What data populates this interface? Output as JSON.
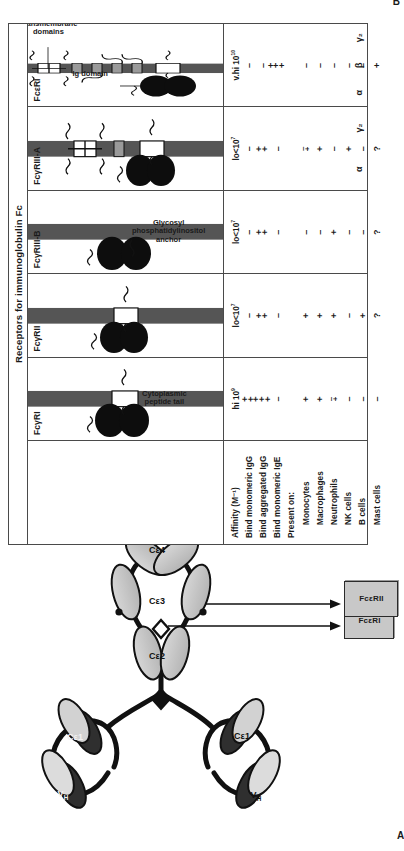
{
  "figure": {
    "panel_a_label": "A",
    "panel_b_label": "B"
  },
  "panel_a": {
    "molecule_domain_labels": {
      "vh": "V",
      "vh_sub": "H",
      "ce1": "Cε1",
      "ce2": "Cε2",
      "ce3": "Cε3",
      "ce4": "Cε4"
    },
    "receptor_boxes": [
      {
        "label": "FcεRI"
      },
      {
        "label": "FcεRII"
      }
    ]
  },
  "panel_b": {
    "table_title": "Receptors for immunoglobulin Fc",
    "annotations": {
      "ig_domain": "Ig domain",
      "transmembrane_domains": "Transmembrane\ndomains",
      "gpi_anchor": "Glycosyl\nphosphatidylinositol\nanchor",
      "cytoplasmic_tail": "Cytoplasmic\npeptide tail"
    },
    "row_labels": [
      {
        "text": "Affinity (M⁻¹)",
        "indent": false
      },
      {
        "text": "Bind monomeric IgG",
        "indent": false
      },
      {
        "text": "Bind aggregated IgG",
        "indent": false
      },
      {
        "text": "Bind monomeric IgE",
        "indent": false
      },
      {
        "text": "Present on:",
        "indent": false
      },
      {
        "text": "Monocytes",
        "indent": true
      },
      {
        "text": "Macrophages",
        "indent": true
      },
      {
        "text": "Neutrophils",
        "indent": true
      },
      {
        "text": "NK cells",
        "indent": true
      },
      {
        "text": "B cells",
        "indent": true
      },
      {
        "text": "Mast cells",
        "indent": true
      }
    ],
    "columns": [
      {
        "name": "FcγRI",
        "subunits": [
          ""
        ],
        "affinity": "hi 10⁹",
        "affinity_base": "hi 10",
        "affinity_exp": "9",
        "values": [
          "++",
          "+++",
          "–",
          "",
          "+",
          "+",
          "+/–",
          "–",
          "–",
          "–"
        ]
      },
      {
        "name": "FcγRII",
        "subunits": [
          ""
        ],
        "affinity": "lo<10⁷",
        "affinity_base": "lo<10",
        "affinity_exp": "7",
        "values": [
          "–",
          "++",
          "–",
          "",
          "+",
          "+",
          "+",
          "–",
          "+",
          "?"
        ]
      },
      {
        "name": "FcγRIII-B",
        "subunits": [
          ""
        ],
        "affinity": "lo<10⁷",
        "affinity_base": "lo<10",
        "affinity_exp": "7",
        "values": [
          "–",
          "++",
          "–",
          "",
          "–",
          "–",
          "+",
          "–",
          "–",
          "?"
        ]
      },
      {
        "name": "FcγRIII-A",
        "subunits": [
          "α",
          "γ₂"
        ],
        "affinity": "lo<10⁷",
        "affinity_base": "lo<10",
        "affinity_exp": "7",
        "values": [
          "–",
          "++",
          "–",
          "",
          "+/–",
          "+",
          "–",
          "+",
          "–",
          "?"
        ]
      },
      {
        "name": "FcεRI",
        "subunits": [
          "α",
          "β",
          "γ₂"
        ],
        "affinity": "v.hi 10¹⁰",
        "affinity_base": "v.hi 10",
        "affinity_exp": "10",
        "values": [
          "–",
          "–",
          "+++",
          "",
          "–",
          "–",
          "–",
          "–",
          "–",
          "+"
        ]
      }
    ]
  }
}
